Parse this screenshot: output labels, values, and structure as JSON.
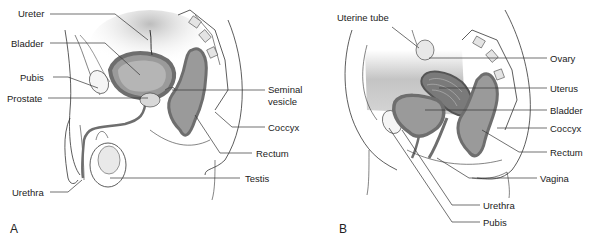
{
  "figure": {
    "type": "anatomical-diagram",
    "line_color": "#333333",
    "organ_fill": "#9a9a9a",
    "organ_wall": "#6e6e6e",
    "shading": "#cfcfcf"
  },
  "panels": [
    {
      "letter": "A",
      "labels": {
        "ureter": "Ureter",
        "bladder": "Bladder",
        "pubis": "Pubis",
        "prostate": "Prostate",
        "seminal_vesicle_1": "Seminal",
        "seminal_vesicle_2": "vesicle",
        "coccyx": "Coccyx",
        "rectum": "Rectum",
        "testis": "Testis",
        "urethra": "Urethra"
      }
    },
    {
      "letter": "B",
      "labels": {
        "uterine_tube": "Uterine tube",
        "ovary": "Ovary",
        "uterus": "Uterus",
        "bladder": "Bladder",
        "coccyx": "Coccyx",
        "rectum": "Rectum",
        "vagina": "Vagina",
        "urethra": "Urethra",
        "pubis": "Pubis"
      }
    }
  ]
}
